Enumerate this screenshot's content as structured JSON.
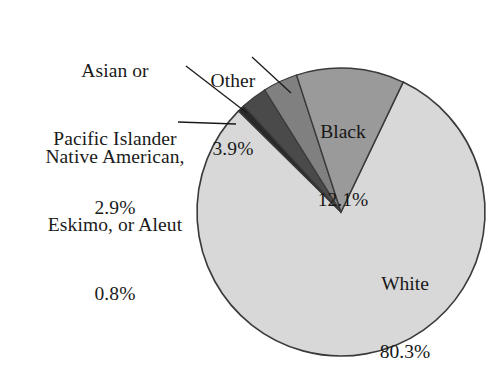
{
  "chart_data": {
    "type": "pie",
    "title": "",
    "categories": [
      "Black",
      "White",
      "Native American, Eskimo, or Aleut",
      "Asian or Pacific Islander",
      "Other"
    ],
    "values": [
      12.1,
      80.3,
      0.8,
      2.9,
      3.9
    ],
    "value_labels": [
      "12.1%",
      "80.3%",
      "0.8%",
      "2.9%",
      "3.9%"
    ],
    "colors": [
      "#9a9a9a",
      "#d8d8d8",
      "#2a2a2a",
      "#4a4a4a",
      "#808080"
    ],
    "legend": "none",
    "label_placement": [
      "inside",
      "inside",
      "outside-leader",
      "outside-leader",
      "outside-leader"
    ],
    "start_angle_deg": -18,
    "direction": "clockwise",
    "stroke_color": "#3a3a3a",
    "background": "#ffffff"
  },
  "labels": {
    "asian": {
      "line1": "Asian or",
      "line2": "Pacific Islander",
      "line3": "2.9%"
    },
    "native": {
      "line1": "Native American,",
      "line2": "Eskimo, or Aleut",
      "line3": "0.8%"
    },
    "other": {
      "line1": "Other",
      "line2": "3.9%"
    },
    "black": {
      "line1": "Black",
      "line2": "12.1%"
    },
    "white": {
      "line1": "White",
      "line2": "80.3%"
    }
  }
}
